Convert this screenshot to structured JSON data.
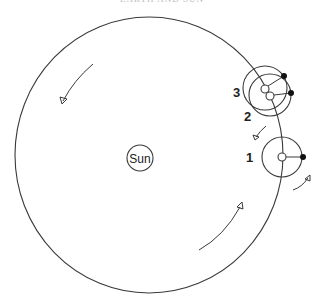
{
  "header": {
    "text": "EARTH AND SUN"
  },
  "diagram": {
    "sun": {
      "label": "Sun"
    },
    "positions": [
      {
        "label": "1"
      },
      {
        "label": "2"
      },
      {
        "label": "3"
      }
    ],
    "colors": {
      "line": "#3a3a3a",
      "marker": "#111111",
      "background": "#ffffff"
    },
    "orbit_direction": "counterclockwise"
  }
}
